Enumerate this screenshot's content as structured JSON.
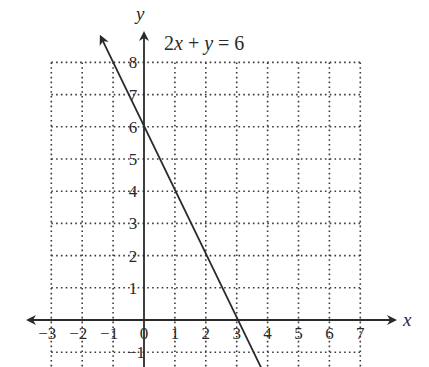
{
  "chart_data": {
    "type": "line",
    "title": "2x + y = 6",
    "xlabel": "x",
    "ylabel": "y",
    "xlim": [
      -3,
      7
    ],
    "ylim": [
      -1,
      8
    ],
    "grid": true,
    "grid_style": "dotted",
    "x_ticks": [
      "-3",
      "-2",
      "-1",
      "0",
      "1",
      "2",
      "3",
      "4",
      "5",
      "6",
      "7"
    ],
    "y_ticks": [
      "8",
      "7",
      "6",
      "5",
      "4",
      "3",
      "2",
      "1",
      "-1"
    ],
    "series": [
      {
        "name": "2x + y = 6",
        "equation": "y = -2x + 6",
        "x": [
          -1.4,
          0,
          1,
          2,
          3,
          3.8
        ],
        "y": [
          8.8,
          6,
          4,
          2,
          0,
          -1.5
        ]
      }
    ],
    "intercepts": {
      "y_intercept": [
        0,
        6
      ],
      "x_intercept": [
        3,
        0
      ]
    }
  },
  "labels": {
    "equation_left": "2",
    "equation_x": "x",
    "equation_mid": " + ",
    "equation_y": "y",
    "equation_right": " = 6",
    "x_axis": "x",
    "y_axis": "y"
  },
  "colors": {
    "ink": "#2a2a2a",
    "grid": "#3a3a3a",
    "background": "#ffffff"
  }
}
